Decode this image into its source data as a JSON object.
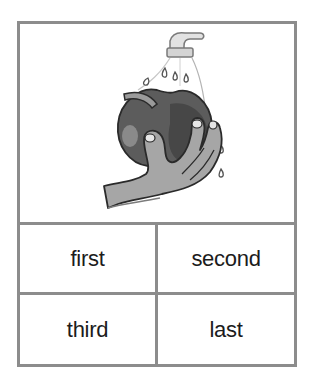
{
  "card": {
    "illustration": {
      "description": "hand holding an apple under a running faucet with water droplets",
      "icon": "washing-apple-illustration",
      "colors": {
        "border": "#8c8c8c",
        "apple": "#5a5a5a",
        "apple_shadow": "#3e3e3e",
        "apple_highlight": "#8a8a8a",
        "hand": "#a6a6a6",
        "outline": "#2a2a2a",
        "faucet": "#d8d8d8"
      }
    },
    "options": [
      {
        "label": "first"
      },
      {
        "label": "second"
      },
      {
        "label": "third"
      },
      {
        "label": "last"
      }
    ]
  }
}
